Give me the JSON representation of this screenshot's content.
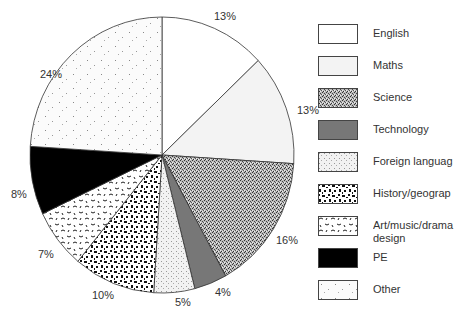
{
  "chart_data": {
    "type": "pie",
    "title": "",
    "categories": [
      "English",
      "Maths",
      "Science",
      "Technology",
      "Foreign language",
      "History/geography",
      "Art/music/drama design",
      "PE",
      "Other"
    ],
    "values": [
      13,
      13,
      16,
      4,
      5,
      10,
      7,
      8,
      24
    ],
    "labels": [
      "13%",
      "13%",
      "16%",
      "4%",
      "5%",
      "10%",
      "7%",
      "8%",
      "24%"
    ],
    "start_angle_deg": 0,
    "direction": "clockwise",
    "legend_position": "right"
  },
  "legend": [
    {
      "label": "English",
      "pattern": "white"
    },
    {
      "label": "Maths",
      "pattern": "light-gray"
    },
    {
      "label": "Science",
      "pattern": "dense-stipple"
    },
    {
      "label": "Technology",
      "pattern": "dark-gray"
    },
    {
      "label": "Foreign languag",
      "pattern": "fine-dots"
    },
    {
      "label": "History/geograp",
      "pattern": "black-blocks"
    },
    {
      "label": "Art/music/drama\ndesign",
      "pattern": "squiggles"
    },
    {
      "label": "PE",
      "pattern": "black"
    },
    {
      "label": "Other",
      "pattern": "sparse-dots"
    }
  ]
}
